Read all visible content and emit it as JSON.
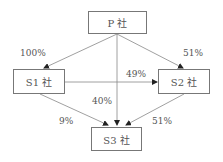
{
  "nodes": {
    "p": {
      "label": "P 社"
    },
    "s1": {
      "label": "S1 社"
    },
    "s2": {
      "label": "S2 社"
    },
    "s3": {
      "label": "S3 社"
    }
  },
  "edges": [
    {
      "from": "P",
      "to": "S1",
      "label": "100%"
    },
    {
      "from": "P",
      "to": "S2",
      "label": "51%"
    },
    {
      "from": "S1",
      "to": "S2",
      "label": "49%"
    },
    {
      "from": "P",
      "to": "S3",
      "label": "40%"
    },
    {
      "from": "S1",
      "to": "S3",
      "label": "9%"
    },
    {
      "from": "S2",
      "to": "S3",
      "label": "51%"
    }
  ],
  "colors": {
    "line": "#777777",
    "arrow": "#222222",
    "text": "#555555"
  }
}
